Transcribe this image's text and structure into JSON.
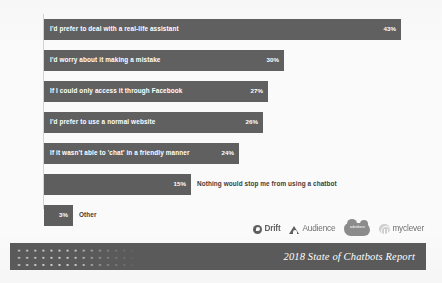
{
  "chart_data": {
    "type": "bar",
    "orientation": "horizontal",
    "title": "",
    "xlabel": "",
    "ylabel": "",
    "xlim": [
      0,
      43
    ],
    "grid": false,
    "legend": false,
    "value_suffix": "%",
    "categories": [
      "I'd prefer to deal with a real-life assistant",
      "I'd worry about it making a mistake",
      "If I could only access it through Facebook",
      "I'd prefer to use a normal website",
      "If it wasn't able to 'chat' in a friendly manner",
      "Nothing would stop me from using a chatbot",
      "Other"
    ],
    "values": [
      43,
      30,
      27,
      26,
      24,
      15,
      3
    ],
    "value_labels": [
      "43%",
      "30%",
      "27%",
      "26%",
      "24%",
      "15%",
      "3%"
    ],
    "bars": [
      {
        "label": "I'd prefer to deal with a real-life assistant",
        "value": 43,
        "value_label": "43%",
        "label_placement": "inside",
        "top": 5,
        "width": 357
      },
      {
        "label": "I'd worry about it making a mistake",
        "value": 30,
        "value_label": "30%",
        "label_placement": "inside",
        "top": 36,
        "width": 240
      },
      {
        "label": "If I could only access it through Facebook",
        "value": 27,
        "value_label": "27%",
        "label_placement": "inside",
        "top": 67,
        "width": 224
      },
      {
        "label": "I'd prefer to use a normal website",
        "value": 26,
        "value_label": "26%",
        "label_placement": "inside",
        "top": 98,
        "width": 219
      },
      {
        "label": "If it wasn't able to 'chat' in a friendly manner",
        "value": 24,
        "value_label": "24%",
        "label_placement": "inside",
        "top": 129,
        "width": 195
      },
      {
        "label": "Nothing would stop me from using a chatbot",
        "value": 15,
        "value_label": "15%",
        "label_placement": "outside",
        "top": 160,
        "width": 147
      },
      {
        "label": "Other",
        "value": 3,
        "value_label": "3%",
        "label_placement": "outside",
        "top": 191,
        "width": 29
      }
    ],
    "colors": {
      "bar": "#5e5e5e",
      "bar_inside_text": "#ffffff",
      "bar_outside_text": "#3c3c3c",
      "axis": "#d2d2d2",
      "background": "#fafafa",
      "footer": "#5a5a5a",
      "footer_text": "#ffffff"
    }
  },
  "logos": [
    {
      "name": "drift",
      "text": "Drift"
    },
    {
      "name": "audience",
      "text": "Audience"
    },
    {
      "name": "salesforce",
      "text": "salesforce"
    },
    {
      "name": "myclever",
      "text": "myclever"
    }
  ],
  "footer": {
    "title": "2018 State of Chatbots Report"
  }
}
